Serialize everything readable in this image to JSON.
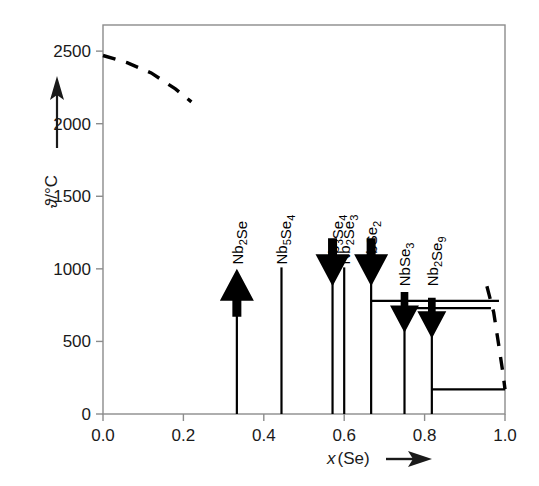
{
  "figure": {
    "title": "",
    "background": "#ffffff",
    "line_color": "#000000",
    "frame_color": "#8c8c8c"
  },
  "axes": {
    "y": {
      "label_symbol": "ϑ",
      "label_unit": "/°C",
      "label_arrow": "↑",
      "ticks": [
        "0",
        "500",
        "1000",
        "1500",
        "2000",
        "2500"
      ],
      "tick_values": [
        0,
        500,
        1000,
        1500,
        2000,
        2500
      ],
      "min": 0,
      "max": 2680
    },
    "x": {
      "label_symbol": "x",
      "label_rest": "(Se)",
      "label_arrow": "➤",
      "ticks": [
        "0.0",
        "0.2",
        "0.4",
        "0.6",
        "0.8",
        "1.0"
      ],
      "tick_values": [
        0.0,
        0.2,
        0.4,
        0.6,
        0.8,
        1.0
      ],
      "min": 0.0,
      "max": 1.0
    }
  },
  "chart_data": {
    "type": "line",
    "title": "",
    "xlabel": "x(Se)",
    "ylabel": "ϑ/°C",
    "xlim": [
      0.0,
      1.0
    ],
    "ylim": [
      0,
      2680
    ],
    "grid": false,
    "legend": "none",
    "compounds": [
      {
        "name": "Nb2Se",
        "label": "Nb₂Se",
        "x": 0.333,
        "line_top": 910,
        "arrow": "up",
        "arrow_tip": 1000,
        "label_y": 1030
      },
      {
        "name": "Nb5Se4",
        "label": "Nb₅Se₄",
        "x": 0.444,
        "line_top": 1010,
        "arrow": "none",
        "arrow_tip": 1010,
        "label_y": 1030
      },
      {
        "name": "Nb3Se4",
        "label": "Nb₃Se₄",
        "x": 0.571,
        "line_top": 990,
        "arrow": "down",
        "arrow_tip": 880,
        "label_y": 1030
      },
      {
        "name": "Nb2Se3",
        "label": "Nb₂Se₃",
        "x": 0.6,
        "line_top": 1010,
        "arrow": "none",
        "arrow_tip": 1010,
        "label_y": 1030
      },
      {
        "name": "NbSe2",
        "label": "NbSe₂",
        "x": 0.667,
        "line_top": 990,
        "arrow": "down",
        "arrow_tip": 880,
        "label_y": 1030
      },
      {
        "name": "NbSe3",
        "label": "NbSe₃",
        "x": 0.75,
        "line_top": 680,
        "arrow": "down",
        "arrow_tip": 560,
        "label_y": 880
      },
      {
        "name": "Nb2Se9",
        "label": "Nb₂Se₉",
        "x": 0.818,
        "line_top": 640,
        "arrow": "down",
        "arrow_tip": 520,
        "label_y": 880
      }
    ],
    "horizontal_lines": [
      {
        "name": "peritectic-780",
        "y": 780,
        "x_start": 0.667,
        "x_end": 0.985
      },
      {
        "name": "peritectic-730",
        "y": 730,
        "x_start": 0.75,
        "x_end": 0.965
      },
      {
        "name": "eutectic-170",
        "y": 170,
        "x_start": 0.818,
        "x_end": 1.0
      }
    ],
    "dashed_curves": [
      {
        "name": "liquidus-left",
        "points": [
          [
            0.0,
            2470
          ],
          [
            0.06,
            2420
          ],
          [
            0.12,
            2350
          ],
          [
            0.18,
            2240
          ],
          [
            0.22,
            2150
          ]
        ]
      },
      {
        "name": "liquidus-right",
        "points": [
          [
            0.955,
            880
          ],
          [
            0.972,
            700
          ],
          [
            0.984,
            480
          ],
          [
            0.995,
            280
          ],
          [
            1.0,
            170
          ]
        ]
      }
    ]
  }
}
